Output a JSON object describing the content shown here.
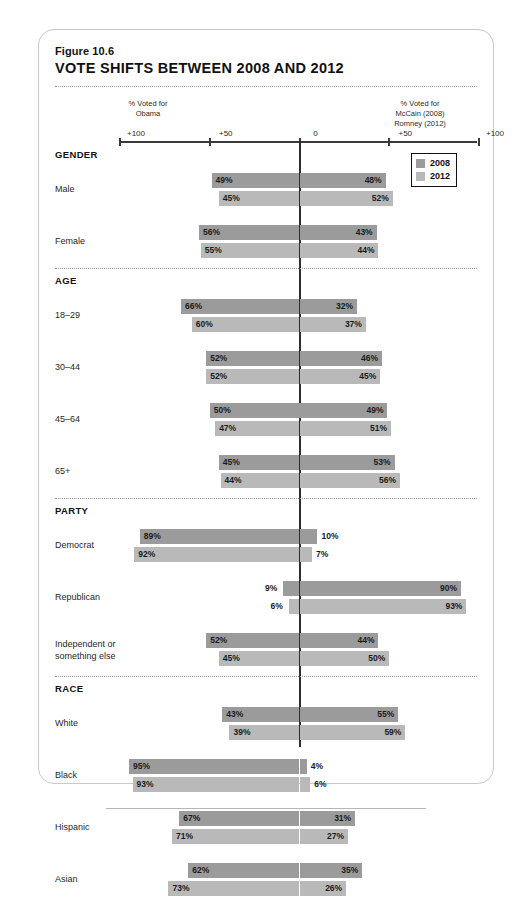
{
  "figure": {
    "number": "Figure 10.6",
    "title": "VOTE SHIFTS BETWEEN 2008 AND 2012"
  },
  "axis": {
    "left_caption": "% Voted for\nObama",
    "left_caption_line1": "% Voted for",
    "left_caption_line2": "Obama",
    "right_caption_line1": "% Voted for",
    "right_caption_line2": "McCain (2008)",
    "right_caption_line3": "Romney (2012)",
    "ticks": [
      {
        "label": "+100",
        "value": -100
      },
      {
        "label": "+50",
        "value": -50
      },
      {
        "label": "0",
        "value": 0
      },
      {
        "label": "+50",
        "value": 50
      },
      {
        "label": "+100",
        "value": 100
      }
    ]
  },
  "legend": {
    "items": [
      {
        "label": "2008",
        "color": "#9b9b9b"
      },
      {
        "label": "2012",
        "color": "#b9b9b9"
      }
    ]
  },
  "chart_data": {
    "type": "bar",
    "title": "VOTE SHIFTS BETWEEN 2008 AND 2012",
    "subtitle": "Figure 10.6",
    "orientation": "horizontal-diverging",
    "xlabel": "",
    "ylabel": "",
    "xlim": [
      -100,
      100
    ],
    "grid": false,
    "legend": [
      "2008",
      "2012"
    ],
    "legend_position": "top-right",
    "left_axis_label": "% Voted for Obama",
    "right_axis_label": "% Voted for McCain (2008) Romney (2012)",
    "tick_labels": [
      "+100",
      "+50",
      "0",
      "+50",
      "+100"
    ],
    "series": [
      {
        "name": "2008",
        "color": "#9b9b9b"
      },
      {
        "name": "2012",
        "color": "#b9b9b9"
      }
    ],
    "sections": [
      {
        "name": "GENDER",
        "rows": [
          {
            "label": "Male",
            "obama_2008": 49,
            "gop_2008": 48,
            "obama_2012": 45,
            "gop_2012": 52,
            "labels": {
              "o08": "49%",
              "g08": "48%",
              "o12": "45%",
              "g12": "52%"
            }
          },
          {
            "label": "Female",
            "obama_2008": 56,
            "gop_2008": 43,
            "obama_2012": 55,
            "gop_2012": 44,
            "labels": {
              "o08": "56%",
              "g08": "43%",
              "o12": "55%",
              "g12": "44%"
            }
          }
        ]
      },
      {
        "name": "AGE",
        "rows": [
          {
            "label": "18–29",
            "obama_2008": 66,
            "gop_2008": 32,
            "obama_2012": 60,
            "gop_2012": 37,
            "labels": {
              "o08": "66%",
              "g08": "32%",
              "o12": "60%",
              "g12": "37%"
            }
          },
          {
            "label": "30–44",
            "obama_2008": 52,
            "gop_2008": 46,
            "obama_2012": 52,
            "gop_2012": 45,
            "labels": {
              "o08": "52%",
              "g08": "46%",
              "o12": "52%",
              "g12": "45%"
            }
          },
          {
            "label": "45–64",
            "obama_2008": 50,
            "gop_2008": 49,
            "obama_2012": 47,
            "gop_2012": 51,
            "labels": {
              "o08": "50%",
              "g08": "49%",
              "o12": "47%",
              "g12": "51%"
            }
          },
          {
            "label": "65+",
            "obama_2008": 45,
            "gop_2008": 53,
            "obama_2012": 44,
            "gop_2012": 56,
            "labels": {
              "o08": "45%",
              "g08": "53%",
              "o12": "44%",
              "g12": "56%"
            }
          }
        ]
      },
      {
        "name": "PARTY",
        "rows": [
          {
            "label": "Democrat",
            "obama_2008": 89,
            "gop_2008": 10,
            "obama_2012": 92,
            "gop_2012": 7,
            "labels": {
              "o08": "89%",
              "g08": "10%",
              "o12": "92%",
              "g12": "7%"
            }
          },
          {
            "label": "Republican",
            "obama_2008": 9,
            "gop_2008": 90,
            "obama_2012": 6,
            "gop_2012": 93,
            "labels": {
              "o08": "9%",
              "g08": "90%",
              "o12": "6%",
              "g12": "93%"
            }
          },
          {
            "label": "Independent or\nsomething else",
            "obama_2008": 52,
            "gop_2008": 44,
            "obama_2012": 45,
            "gop_2012": 50,
            "labels": {
              "o08": "52%",
              "g08": "44%",
              "o12": "45%",
              "g12": "50%"
            }
          }
        ]
      },
      {
        "name": "RACE",
        "rows": [
          {
            "label": "White",
            "obama_2008": 43,
            "gop_2008": 55,
            "obama_2012": 39,
            "gop_2012": 59,
            "labels": {
              "o08": "43%",
              "g08": "55%",
              "o12": "39%",
              "g12": "59%"
            }
          },
          {
            "label": "Black",
            "obama_2008": 95,
            "gop_2008": 4,
            "obama_2012": 93,
            "gop_2012": 6,
            "labels": {
              "o08": "95%",
              "g08": "4%",
              "o12": "93%",
              "g12": "6%"
            }
          },
          {
            "label": "Hispanic",
            "obama_2008": 67,
            "gop_2008": 31,
            "obama_2012": 71,
            "gop_2012": 27,
            "labels": {
              "o08": "67%",
              "g08": "31%",
              "o12": "71%",
              "g12": "27%"
            }
          },
          {
            "label": "Asian",
            "obama_2008": 62,
            "gop_2008": 35,
            "obama_2012": 73,
            "gop_2012": 26,
            "labels": {
              "o08": "62%",
              "g08": "35%",
              "o12": "73%",
              "g12": "26%"
            }
          }
        ]
      }
    ]
  }
}
